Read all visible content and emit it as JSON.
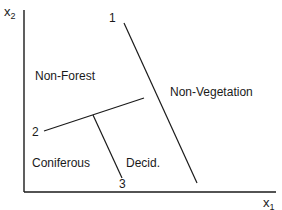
{
  "axes": {
    "x": {
      "base": "x",
      "subscript": "1"
    },
    "y": {
      "base": "x",
      "subscript": "2"
    }
  },
  "boundaries": [
    {
      "id": "1",
      "label": "1",
      "from": [
        124,
        23
      ],
      "to": [
        197,
        183
      ]
    },
    {
      "id": "2",
      "label": "2",
      "from": [
        44,
        131
      ],
      "to": [
        144,
        98
      ]
    },
    {
      "id": "3",
      "label": "3",
      "from": [
        93,
        115
      ],
      "to": [
        122,
        178
      ]
    }
  ],
  "regions": [
    {
      "id": "non-forest",
      "label": "Non-Forest"
    },
    {
      "id": "non-vegetation",
      "label": "Non-Vegetation"
    },
    {
      "id": "coniferous",
      "label": "Coniferous"
    },
    {
      "id": "deciduous",
      "label": "Decid."
    }
  ],
  "colors": {
    "line": "#1a1a1a",
    "background": "#ffffff"
  }
}
